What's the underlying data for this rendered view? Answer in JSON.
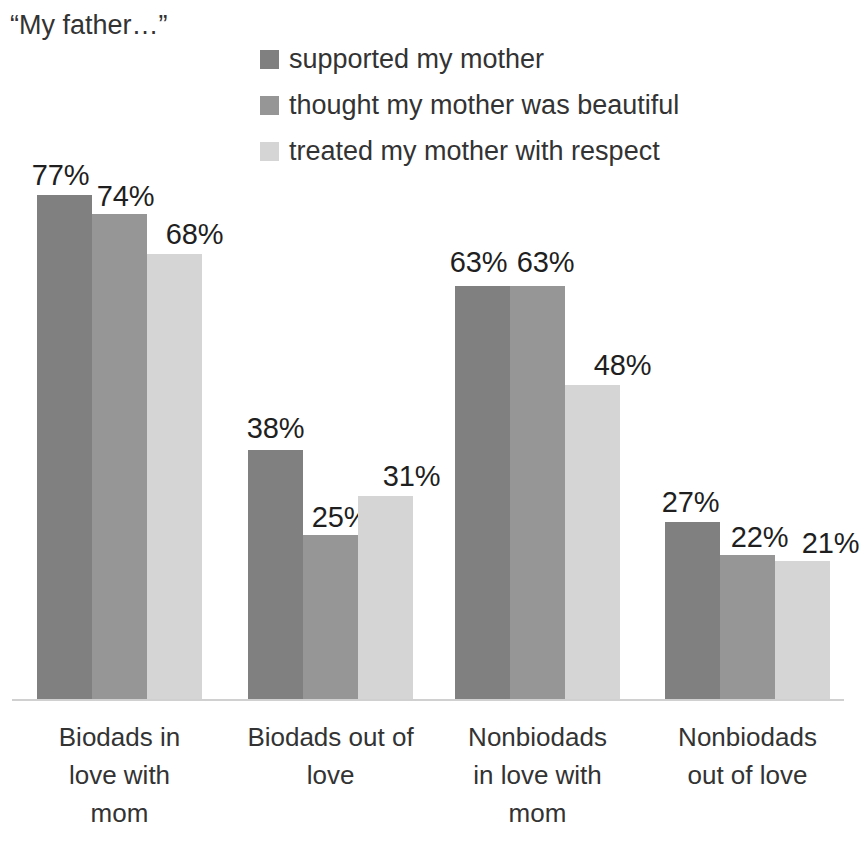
{
  "title": "“My father…”",
  "legend": {
    "position": "top-right",
    "items": [
      {
        "label": "supported my mother",
        "color": "#808080",
        "swatch_icon": "series-swatch-icon"
      },
      {
        "label": "thought my mother was beautiful",
        "color": "#969696",
        "swatch_icon": "series-swatch-icon"
      },
      {
        "label": "treated my mother with respect",
        "color": "#d5d5d5",
        "swatch_icon": "series-swatch-icon"
      }
    ]
  },
  "chart_data": {
    "type": "bar",
    "title": "“My father…”",
    "xlabel": "",
    "ylabel": "",
    "ylim": [
      0,
      85
    ],
    "grid": false,
    "value_suffix": "%",
    "legend_position": "top-right",
    "categories": [
      "Biodads in love with mom",
      "Biodads out of love",
      "Nonbiodads in love with mom",
      "Nonbiodads out of love"
    ],
    "category_lines": [
      [
        "Biodads in",
        "love with",
        "mom"
      ],
      [
        "Biodads out of",
        "love"
      ],
      [
        "Nonbiodads",
        "in love with",
        "mom"
      ],
      [
        "Nonbiodads",
        "out of love"
      ]
    ],
    "series": [
      {
        "name": "supported my mother",
        "color": "#808080",
        "values": [
          77,
          38,
          63,
          27
        ]
      },
      {
        "name": "thought my mother was beautiful",
        "color": "#969696",
        "values": [
          74,
          25,
          63,
          22
        ]
      },
      {
        "name": "treated my mother with respect",
        "color": "#d5d5d5",
        "values": [
          68,
          31,
          48,
          21
        ]
      }
    ],
    "data_labels": [
      [
        "77%",
        "74%",
        "68%"
      ],
      [
        "38%",
        "25%",
        "31%"
      ],
      [
        "63%",
        "63%",
        "48%"
      ],
      [
        "27%",
        "22%",
        "21%"
      ]
    ]
  },
  "axis": {
    "baseline_color": "#d0d0d0"
  }
}
